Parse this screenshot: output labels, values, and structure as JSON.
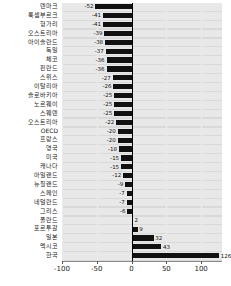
{
  "chart_data": {
    "type": "bar",
    "orientation": "horizontal",
    "title": "",
    "subtitle": "",
    "xlabel": "",
    "ylabel": "",
    "xlim": [
      -100,
      130
    ],
    "xticks": [
      -100,
      -50,
      0,
      50,
      100
    ],
    "xtick_labels": [
      "-100",
      "-50",
      "0",
      "50",
      "100"
    ],
    "grid": true,
    "legend": "none",
    "bar_color": "#111111",
    "plot_background": "#d9d9d9",
    "categories": [
      "덴마크",
      "룩셈부르크",
      "헝가리",
      "오스트리아",
      "아이슬란드",
      "독일",
      "체코",
      "핀란드",
      "스위스",
      "이탈리아",
      "슬로바키아",
      "노르웨이",
      "스웨덴",
      "오스트리아",
      "OECD",
      "프랑스",
      "영국",
      "미국",
      "캐나다",
      "아일랜드",
      "뉴질랜드",
      "스페인",
      "네덜란드",
      "그리스",
      "폴란드",
      "포르투갈",
      "일본",
      "멕시코",
      "한국"
    ],
    "values": [
      -52,
      -41,
      -41,
      -39,
      -38,
      -37,
      -36,
      -36,
      -27,
      -26,
      -25,
      -25,
      -25,
      -22,
      -20,
      -20,
      -18,
      -15,
      -15,
      -12,
      -9,
      -7,
      -7,
      -6,
      2,
      9,
      32,
      43,
      126
    ],
    "data_labels": [
      "-52",
      "-41",
      "-41",
      "-39",
      "-38",
      "-37",
      "-36",
      "-36",
      "-27",
      "-26",
      "-25",
      "-25",
      "-25",
      "-22",
      "-20",
      "-20",
      "-18",
      "-15",
      "-15",
      "-12",
      "-9",
      "-7",
      "-7",
      "-6",
      "2",
      "9",
      "32",
      "43",
      "126"
    ]
  }
}
